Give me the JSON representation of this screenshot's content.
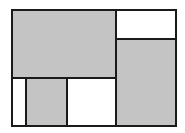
{
  "diagram": {
    "type": "rectangle-partition",
    "frame": {
      "x": 11,
      "y": 9,
      "w": 166,
      "h": 118
    },
    "colors": {
      "shaded": "#c4c4c4",
      "white": "#ffffff",
      "stroke": "#1a1a1a"
    },
    "regions": [
      {
        "id": "top-left-large",
        "x": 11,
        "y": 9,
        "w": 106,
        "h": 70,
        "fill": "shaded"
      },
      {
        "id": "top-right-small",
        "x": 115,
        "y": 9,
        "w": 62,
        "h": 31,
        "fill": "white"
      },
      {
        "id": "right-tall",
        "x": 115,
        "y": 38,
        "w": 62,
        "h": 89,
        "fill": "shaded"
      },
      {
        "id": "bottom-left-narrow",
        "x": 11,
        "y": 77,
        "w": 16,
        "h": 50,
        "fill": "white"
      },
      {
        "id": "bottom-middle-left",
        "x": 25,
        "y": 77,
        "w": 43,
        "h": 50,
        "fill": "shaded"
      },
      {
        "id": "bottom-middle-right",
        "x": 66,
        "y": 77,
        "w": 51,
        "h": 50,
        "fill": "white"
      }
    ]
  }
}
